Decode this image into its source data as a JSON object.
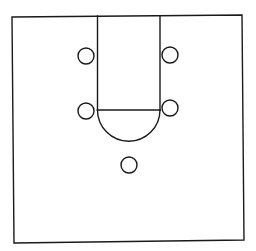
{
  "diagram": {
    "type": "basketball-half-court",
    "colors": {
      "line": "#1a1a1a",
      "background": "#ffffff"
    },
    "boundary": {
      "points": "12,17 242,15 244,240 14,243"
    },
    "lane": {
      "left_x": 97.5,
      "right_x": 160,
      "top_y": 16,
      "free_throw_y": 110
    },
    "free_throw_arc": {
      "cx": 128.75,
      "cy": 110,
      "r": 31.25,
      "bottom_y": 141.5
    },
    "players": [
      {
        "id": "left-high",
        "cx": 86,
        "cy": 56,
        "r": 8
      },
      {
        "id": "right-high",
        "cx": 170,
        "cy": 55,
        "r": 8
      },
      {
        "id": "left-elbow",
        "cx": 86,
        "cy": 111,
        "r": 8
      },
      {
        "id": "right-elbow",
        "cx": 170,
        "cy": 108,
        "r": 8
      },
      {
        "id": "top-key",
        "cx": 129,
        "cy": 165,
        "r": 8
      }
    ]
  }
}
